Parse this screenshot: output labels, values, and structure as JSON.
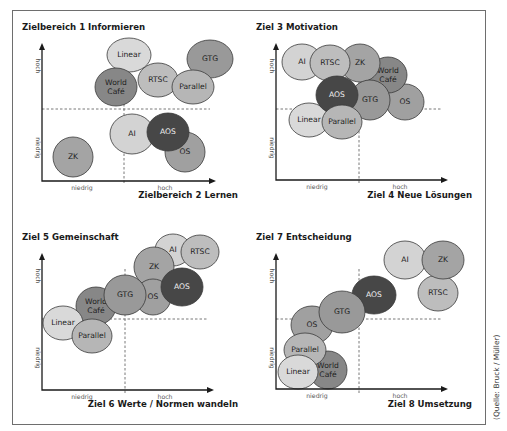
{
  "figure": {
    "source_note": "(Quelle: Bruck / Müller)",
    "axis_labels": {
      "low": "niedrig",
      "high": "hoch"
    }
  },
  "colors": {
    "AI": "#d3d3d3",
    "Linear": "#d9d9d9",
    "RTSC": "#bdbdbd",
    "Parallel": "#b6b6b6",
    "ZK": "#a4a4a4",
    "OS": "#a0a0a0",
    "GTG": "#999999",
    "World Café": "#878787",
    "AOS": "#474747"
  },
  "chart_data": [
    {
      "type": "scatter",
      "title": "Zielbereich 1 Informieren",
      "xlabel": "Zielbereich 2 Lernen",
      "ylabel": "Zielbereich 1 Informieren",
      "x_ticks": [
        "niedrig",
        "hoch"
      ],
      "y_ticks": [
        "niedrig",
        "hoch"
      ],
      "layout": {
        "ox": 42,
        "oy": 181,
        "xend": 215,
        "ytop": 44,
        "dashx": 124,
        "dashy": 109,
        "title_x": 22,
        "title_y": 30,
        "xlabel_x": 238,
        "xlabel_y": 198,
        "low_x": 82,
        "high_x": 165,
        "ylow_y": 148,
        "yhigh_y": 66
      },
      "points": [
        {
          "label": "ZK",
          "x": 73,
          "y": 157,
          "rx": 20,
          "ry": 20
        },
        {
          "label": "Linear",
          "x": 129,
          "y": 55,
          "rx": 22,
          "ry": 17
        },
        {
          "label": "World Café",
          "x": 116,
          "y": 87,
          "rx": 21,
          "ry": 19
        },
        {
          "label": "GTG",
          "x": 210,
          "y": 59,
          "rx": 23,
          "ry": 19
        },
        {
          "label": "RTSC",
          "x": 158,
          "y": 80,
          "rx": 20,
          "ry": 17
        },
        {
          "label": "Parallel",
          "x": 193,
          "y": 87,
          "rx": 21,
          "ry": 17
        },
        {
          "label": "AI",
          "x": 132,
          "y": 134,
          "rx": 22,
          "ry": 20
        },
        {
          "label": "OS",
          "x": 185,
          "y": 152,
          "rx": 20,
          "ry": 20
        },
        {
          "label": "AOS",
          "x": 168,
          "y": 132,
          "rx": 21,
          "ry": 19
        }
      ]
    },
    {
      "type": "scatter",
      "title": "Ziel 3 Motivation",
      "xlabel": "Ziel 4 Neue Lösungen",
      "ylabel": "Ziel 3 Motivation",
      "x_ticks": [
        "niedrig",
        "hoch"
      ],
      "y_ticks": [
        "niedrig",
        "hoch"
      ],
      "layout": {
        "ox": 276,
        "oy": 180,
        "xend": 447,
        "ytop": 44,
        "dashx": 359,
        "dashy": 109,
        "title_x": 256,
        "title_y": 30,
        "xlabel_x": 472,
        "xlabel_y": 198,
        "low_x": 317,
        "high_x": 400,
        "ylow_y": 148,
        "yhigh_y": 66
      },
      "points": [
        {
          "label": "AI",
          "x": 302,
          "y": 62,
          "rx": 20,
          "ry": 18
        },
        {
          "label": "OS",
          "x": 405,
          "y": 102,
          "rx": 19,
          "ry": 18
        },
        {
          "label": "World Café",
          "x": 388,
          "y": 75,
          "rx": 19,
          "ry": 18
        },
        {
          "label": "ZK",
          "x": 360,
          "y": 63,
          "rx": 20,
          "ry": 19
        },
        {
          "label": "RTSC",
          "x": 330,
          "y": 63,
          "rx": 20,
          "ry": 18
        },
        {
          "label": "GTG",
          "x": 370,
          "y": 100,
          "rx": 20,
          "ry": 20
        },
        {
          "label": "Linear",
          "x": 309,
          "y": 120,
          "rx": 20,
          "ry": 17
        },
        {
          "label": "AOS",
          "x": 337,
          "y": 95,
          "rx": 21,
          "ry": 19
        },
        {
          "label": "Parallel",
          "x": 342,
          "y": 122,
          "rx": 20,
          "ry": 17
        }
      ]
    },
    {
      "type": "scatter",
      "title": "Ziel 5 Gemeinschaft",
      "xlabel": "Ziel 6 Werte / Normen wandeln",
      "ylabel": "Ziel 5 Gemeinschaft",
      "x_ticks": [
        "niedrig",
        "hoch"
      ],
      "y_ticks": [
        "niedrig",
        "hoch"
      ],
      "layout": {
        "ox": 42,
        "oy": 390,
        "xend": 213,
        "ytop": 254,
        "dashx": 125,
        "dashy": 319,
        "title_x": 22,
        "title_y": 240,
        "xlabel_x": 238,
        "xlabel_y": 407,
        "low_x": 82,
        "high_x": 165,
        "ylow_y": 358,
        "yhigh_y": 276
      },
      "points": [
        {
          "label": "AI",
          "x": 173,
          "y": 250,
          "rx": 18,
          "ry": 16
        },
        {
          "label": "RTSC",
          "x": 200,
          "y": 252,
          "rx": 19,
          "ry": 17
        },
        {
          "label": "ZK",
          "x": 154,
          "y": 267,
          "rx": 20,
          "ry": 20
        },
        {
          "label": "OS",
          "x": 153,
          "y": 297,
          "rx": 18,
          "ry": 18
        },
        {
          "label": "AOS",
          "x": 182,
          "y": 287,
          "rx": 21,
          "ry": 19
        },
        {
          "label": "World Café",
          "x": 96,
          "y": 306,
          "rx": 20,
          "ry": 19
        },
        {
          "label": "GTG",
          "x": 125,
          "y": 295,
          "rx": 21,
          "ry": 20
        },
        {
          "label": "Linear",
          "x": 63,
          "y": 323,
          "rx": 20,
          "ry": 17
        },
        {
          "label": "Parallel",
          "x": 92,
          "y": 336,
          "rx": 20,
          "ry": 17
        }
      ]
    },
    {
      "type": "scatter",
      "title": "Ziel 7 Entscheidung",
      "xlabel": "Ziel 8 Umsetzung",
      "ylabel": "Ziel 7 Entscheidung",
      "x_ticks": [
        "niedrig",
        "hoch"
      ],
      "y_ticks": [
        "niedrig",
        "hoch"
      ],
      "layout": {
        "ox": 276,
        "oy": 389,
        "xend": 447,
        "ytop": 254,
        "dashx": 359,
        "dashy": 319,
        "title_x": 256,
        "title_y": 240,
        "xlabel_x": 472,
        "xlabel_y": 407,
        "low_x": 317,
        "high_x": 400,
        "ylow_y": 358,
        "yhigh_y": 276
      },
      "points": [
        {
          "label": "AI",
          "x": 405,
          "y": 260,
          "rx": 21,
          "ry": 19
        },
        {
          "label": "RTSC",
          "x": 438,
          "y": 293,
          "rx": 20,
          "ry": 18
        },
        {
          "label": "ZK",
          "x": 443,
          "y": 260,
          "rx": 21,
          "ry": 19
        },
        {
          "label": "AOS",
          "x": 374,
          "y": 295,
          "rx": 22,
          "ry": 19
        },
        {
          "label": "OS",
          "x": 312,
          "y": 325,
          "rx": 21,
          "ry": 19
        },
        {
          "label": "GTG",
          "x": 342,
          "y": 312,
          "rx": 23,
          "ry": 21
        },
        {
          "label": "World Café",
          "x": 328,
          "y": 370,
          "rx": 19,
          "ry": 19
        },
        {
          "label": "Parallel",
          "x": 305,
          "y": 350,
          "rx": 21,
          "ry": 17
        },
        {
          "label": "Linear",
          "x": 298,
          "y": 372,
          "rx": 20,
          "ry": 17
        }
      ]
    }
  ]
}
